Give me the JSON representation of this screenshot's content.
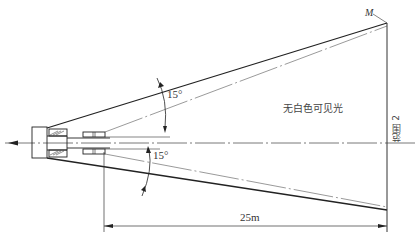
{
  "diagram": {
    "labels": {
      "angle_upper": "15°",
      "angle_lower": "15°",
      "beam_description": "无白色可见光",
      "point_m": "M",
      "range_label": "范围 2",
      "distance": "25m"
    },
    "colors": {
      "line": "#222222",
      "thin_line": "#555555",
      "background": "#ffffff"
    },
    "geometry": {
      "beam_half_angle_deg": 15,
      "distance_m": 25
    }
  }
}
